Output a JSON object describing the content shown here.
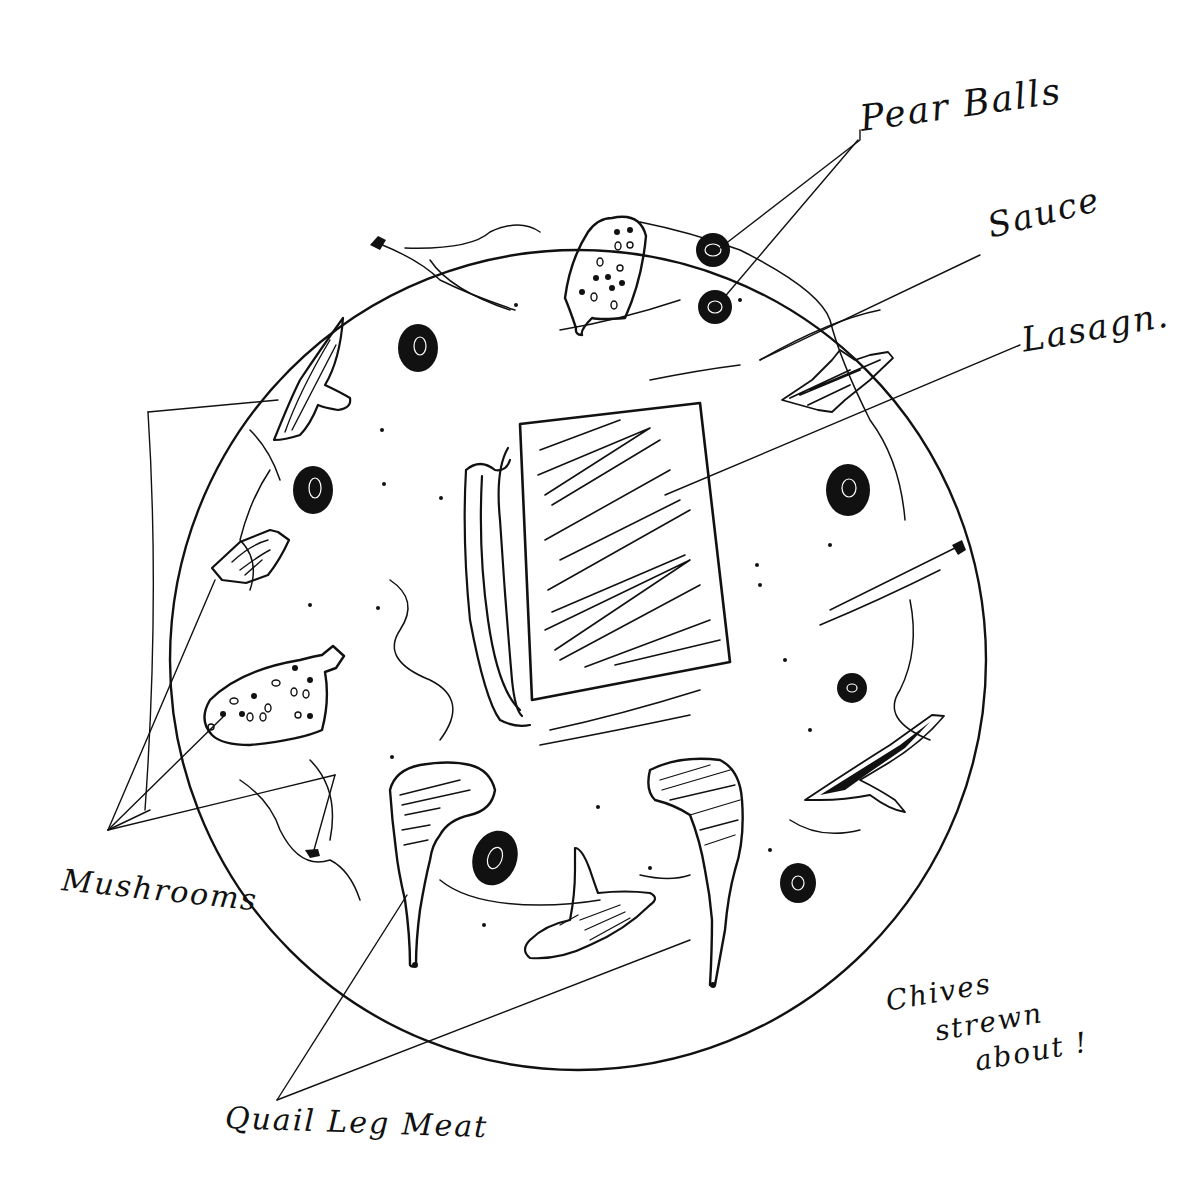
{
  "diagram": {
    "type": "plating-sketch",
    "colors": {
      "ink": "#111111",
      "paper": "#ffffff"
    },
    "plate": {
      "cx": 578,
      "cy": 660,
      "r": 408
    },
    "labels": {
      "pear_balls": "Pear Balls",
      "sauce": "Sauce",
      "lasagna": "Lasagn.",
      "mushrooms": "Mushrooms",
      "chives_line1": "Chives",
      "chives_line2": "strewn",
      "chives_line3": "about !",
      "quail_leg_meat": "Quail Leg Meat"
    },
    "components": [
      {
        "name": "Lasagna",
        "count": 1,
        "position": "center"
      },
      {
        "name": "Pear Balls",
        "count": 7
      },
      {
        "name": "Mushrooms",
        "count": 4
      },
      {
        "name": "Quail Leg Meat",
        "count": 3
      },
      {
        "name": "Sauce",
        "style": "swirls"
      },
      {
        "name": "Chives",
        "style": "strewn about"
      }
    ]
  }
}
